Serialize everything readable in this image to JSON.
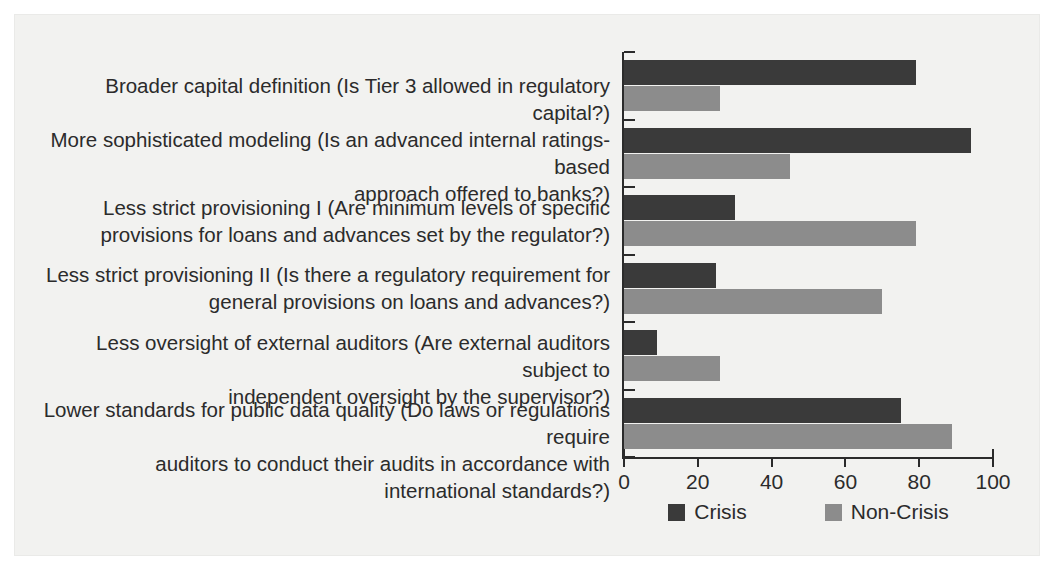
{
  "chart_data": {
    "type": "bar",
    "orientation": "horizontal",
    "title": "",
    "subtitle": "",
    "xlabel": "",
    "ylabel": "",
    "xlim": [
      0,
      100
    ],
    "xticks": [
      0,
      20,
      40,
      60,
      80,
      100
    ],
    "xtick_labels": [
      "0",
      "20",
      "40",
      "60",
      "80",
      "100"
    ],
    "grid": false,
    "legend_position": "bottom-center",
    "colors": {
      "crisis": "#3a3a3a",
      "non_crisis": "#8c8c8c",
      "axis": "#2b2b2b",
      "panel_background": "#f2f2f0",
      "page_background": "#ffffff",
      "text": "#2b2b2b"
    },
    "categories": [
      "Broader capital definition (Is Tier 3 allowed in regulatory capital?)",
      "More sophisticated modeling (Is an advanced internal ratings-based approach offered to banks?)",
      "Less strict provisioning I (Are minimum levels of specific provisions for loans and advances set by the regulator?)",
      "Less strict provisioning II (Is there a regulatory requirement for general provisions on loans and advances?)",
      "Less oversight of external auditors (Are external auditors subject to independent oversight by the supervisor?)",
      "Lower standards for public data quality (Do laws or regulations require auditors to conduct their audits in accordance with international standards?)"
    ],
    "category_lines": [
      [
        "Broader capital definition (Is Tier 3 allowed in regulatory capital?)"
      ],
      [
        "More sophisticated modeling (Is an advanced internal ratings-based",
        "approach offered to banks?)"
      ],
      [
        "Less strict provisioning I (Are minimum levels of specific",
        "provisions for loans and advances set by the regulator?)"
      ],
      [
        "Less strict provisioning II (Is there a regulatory requirement for",
        "general provisions on loans and advances?)"
      ],
      [
        "Less oversight of external auditors (Are external auditors subject to",
        "independent oversight by the supervisor?)"
      ],
      [
        "Lower standards for public data quality (Do laws or regulations require",
        "auditors to conduct their audits in accordance with international standards?)"
      ]
    ],
    "series": [
      {
        "name": "Crisis",
        "color": "#3a3a3a",
        "values": [
          79,
          94,
          30,
          25,
          9,
          75
        ]
      },
      {
        "name": "Non-Crisis",
        "color": "#8c8c8c",
        "values": [
          26,
          45,
          79,
          70,
          26,
          89
        ]
      }
    ]
  },
  "legend": {
    "items": [
      {
        "label": "Crisis",
        "swatch": "crisis"
      },
      {
        "label": "Non-Crisis",
        "swatch": "noncrisis"
      }
    ]
  }
}
